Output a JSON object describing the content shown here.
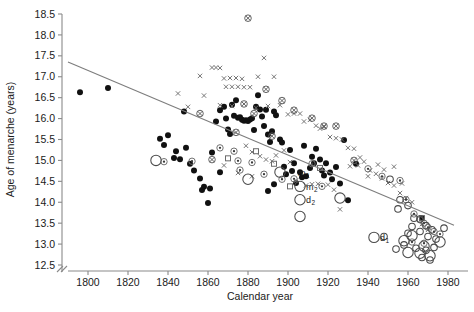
{
  "chart_data": {
    "type": "scatter",
    "title": "",
    "xlabel": "Calendar year",
    "ylabel": "Age of menarche (years)",
    "xlim": [
      1788,
      1990
    ],
    "ylim": [
      12.5,
      18.5
    ],
    "xticks": [
      "1800",
      "1820",
      "1840",
      "1860",
      "1880",
      "1900",
      "1920",
      "1940",
      "1960",
      "1980"
    ],
    "xtick_values": [
      1800,
      1820,
      1840,
      1860,
      1880,
      1900,
      1920,
      1940,
      1960,
      1980
    ],
    "yticks": [
      "12.5",
      "13.0",
      "13.5",
      "14.0",
      "14.5",
      "15.0",
      "15.5",
      "16.0",
      "16.5",
      "17.0",
      "17.5",
      "18.0",
      "18.5"
    ],
    "ytick_values": [
      12.5,
      13.0,
      13.5,
      14.0,
      14.5,
      15.0,
      15.5,
      16.0,
      16.5,
      17.0,
      17.5,
      18.0,
      18.5
    ],
    "grid": false,
    "axis_break": true,
    "legend_position": "none",
    "trend_line": {
      "name": "linear regression",
      "x": [
        1790,
        1983
      ],
      "y": [
        17.35,
        13.45
      ],
      "color": "#7d7d7d"
    },
    "annotations": [
      {
        "label": "m",
        "sub": "1",
        "x": 1902,
        "y": 14.72
      },
      {
        "label": "m",
        "sub": "2",
        "x": 1906,
        "y": 14.38
      },
      {
        "label": "d",
        "sub": "2",
        "x": 1906,
        "y": 14.06
      },
      {
        "label": "d",
        "sub": "1",
        "x": 1943,
        "y": 13.16
      }
    ],
    "series": [
      {
        "name": "filled-circle",
        "marker": "filled-circle",
        "color": "#111111",
        "points": [
          [
            1796,
            16.63
          ],
          [
            1810,
            16.73
          ],
          [
            1838,
            15.37
          ],
          [
            1843,
            15.06
          ],
          [
            1846,
            15.03
          ],
          [
            1849,
            15.3
          ],
          [
            1851,
            14.92
          ],
          [
            1853,
            14.76
          ],
          [
            1856,
            14.57
          ],
          [
            1858,
            14.37
          ],
          [
            1857,
            14.29
          ],
          [
            1861,
            14.33
          ],
          [
            1848,
            16.17
          ],
          [
            1862,
            15.19
          ],
          [
            1864,
            15.93
          ],
          [
            1866,
            16.2
          ],
          [
            1868,
            16.28
          ],
          [
            1869,
            16.0
          ],
          [
            1870,
            15.74
          ],
          [
            1871,
            15.63
          ],
          [
            1872,
            16.33
          ],
          [
            1873,
            16.07
          ],
          [
            1874,
            16.44
          ],
          [
            1875,
            16.02
          ],
          [
            1876,
            16.03
          ],
          [
            1877,
            15.97
          ],
          [
            1878,
            15.95
          ],
          [
            1879,
            15.96
          ],
          [
            1880,
            15.94
          ],
          [
            1881,
            15.98
          ],
          [
            1882,
            16.01
          ],
          [
            1883,
            15.73
          ],
          [
            1884,
            16.28
          ],
          [
            1885,
            16.56
          ],
          [
            1886,
            16.22
          ],
          [
            1887,
            16.05
          ],
          [
            1888,
            15.82
          ],
          [
            1889,
            16.21
          ],
          [
            1890,
            15.62
          ],
          [
            1891,
            15.44
          ],
          [
            1892,
            15.7
          ],
          [
            1893,
            16.17
          ],
          [
            1894,
            16.08
          ],
          [
            1896,
            15.5
          ],
          [
            1897,
            15.43
          ],
          [
            1898,
            14.85
          ],
          [
            1899,
            14.67
          ],
          [
            1901,
            15.25
          ],
          [
            1903,
            14.93
          ],
          [
            1904,
            14.46
          ],
          [
            1906,
            14.72
          ],
          [
            1907,
            14.6
          ],
          [
            1908,
            15.35
          ],
          [
            1909,
            14.62
          ],
          [
            1911,
            14.82
          ],
          [
            1912,
            15.09
          ],
          [
            1913,
            14.93
          ],
          [
            1914,
            15.28
          ],
          [
            1916,
            15.02
          ],
          [
            1917,
            14.76
          ],
          [
            1918,
            14.64
          ],
          [
            1919,
            14.93
          ],
          [
            1921,
            14.71
          ],
          [
            1922,
            14.55
          ],
          [
            1924,
            14.84
          ],
          [
            1926,
            14.45
          ],
          [
            1928,
            15.49
          ],
          [
            1930,
            14.05
          ],
          [
            1860,
            13.98
          ],
          [
            1866,
            14.72
          ],
          [
            1890,
            14.27
          ],
          [
            1893,
            14.43
          ],
          [
            1902,
            14.75
          ],
          [
            1934,
            14.92
          ],
          [
            1836,
            15.52
          ],
          [
            1840,
            15.6
          ],
          [
            1844,
            15.22
          ],
          [
            1967,
            13.62
          ]
        ]
      },
      {
        "name": "x-marker",
        "marker": "x",
        "color": "#6f6f6f",
        "points": [
          [
            1856,
            17.02
          ],
          [
            1862,
            17.22
          ],
          [
            1864,
            17.22
          ],
          [
            1866,
            17.21
          ],
          [
            1868,
            16.96
          ],
          [
            1871,
            16.97
          ],
          [
            1874,
            16.97
          ],
          [
            1877,
            16.95
          ],
          [
            1869,
            16.76
          ],
          [
            1872,
            16.76
          ],
          [
            1875,
            16.76
          ],
          [
            1878,
            16.75
          ],
          [
            1881,
            16.75
          ],
          [
            1885,
            17.0
          ],
          [
            1888,
            17.45
          ],
          [
            1893,
            17.0
          ],
          [
            1858,
            16.55
          ],
          [
            1866,
            16.32
          ],
          [
            1872,
            16.3
          ],
          [
            1884,
            16.26
          ],
          [
            1890,
            16.3
          ],
          [
            1896,
            16.32
          ],
          [
            1900,
            16.1
          ],
          [
            1903,
            16.12
          ],
          [
            1906,
            16.12
          ],
          [
            1908,
            15.93
          ],
          [
            1911,
            15.97
          ],
          [
            1914,
            15.83
          ],
          [
            1916,
            15.76
          ],
          [
            1918,
            15.8
          ],
          [
            1921,
            15.56
          ],
          [
            1924,
            15.53
          ],
          [
            1927,
            15.5
          ],
          [
            1930,
            15.3
          ],
          [
            1933,
            15.28
          ],
          [
            1936,
            15.07
          ],
          [
            1938,
            14.97
          ],
          [
            1941,
            14.76
          ],
          [
            1944,
            14.68
          ],
          [
            1947,
            14.57
          ],
          [
            1950,
            14.46
          ],
          [
            1953,
            14.4
          ],
          [
            1956,
            14.22
          ],
          [
            1959,
            14.1
          ],
          [
            1962,
            14.0
          ],
          [
            1879,
            15.35
          ],
          [
            1882,
            15.2
          ],
          [
            1886,
            15.1
          ],
          [
            1889,
            15.02
          ],
          [
            1892,
            14.98
          ],
          [
            1894,
            15.12
          ],
          [
            1898,
            15.24
          ],
          [
            1901,
            14.96
          ],
          [
            1904,
            14.52
          ],
          [
            1909,
            14.4
          ],
          [
            1912,
            14.43
          ],
          [
            1915,
            14.44
          ],
          [
            1920,
            14.42
          ],
          [
            1923,
            14.3
          ],
          [
            1926,
            13.83
          ],
          [
            1931,
            14.86
          ],
          [
            1935,
            14.88
          ],
          [
            1940,
            14.62
          ],
          [
            1945,
            14.9
          ],
          [
            1948,
            14.78
          ],
          [
            1953,
            14.85
          ],
          [
            1957,
            14.45
          ],
          [
            1967,
            13.48
          ],
          [
            1970,
            13.34
          ],
          [
            1845,
            16.6
          ],
          [
            1850,
            16.28
          ],
          [
            1868,
            14.88
          ],
          [
            1875,
            14.7
          ],
          [
            1882,
            14.62
          ]
        ]
      },
      {
        "name": "dotted-circle",
        "marker": "dotted-circle",
        "color": "#6a6a6a",
        "points": [
          [
            1838,
            14.97
          ],
          [
            1852,
            14.98
          ],
          [
            1866,
            15.3
          ],
          [
            1873,
            15.22
          ],
          [
            1875,
            14.99
          ],
          [
            1876,
            14.77
          ],
          [
            1882,
            14.95
          ],
          [
            1888,
            14.67
          ],
          [
            1897,
            14.55
          ],
          [
            1903,
            14.56
          ],
          [
            1912,
            14.92
          ],
          [
            1917,
            14.38
          ],
          [
            1940,
            14.8
          ],
          [
            1947,
            14.62
          ],
          [
            1956,
            14.52
          ],
          [
            1963,
            13.72
          ],
          [
            1966,
            13.58
          ],
          [
            1968,
            13.5
          ],
          [
            1970,
            13.4
          ],
          [
            1973,
            13.3
          ],
          [
            1962,
            13.05
          ],
          [
            1968,
            13.02
          ],
          [
            1976,
            13.24
          ],
          [
            1959,
            14.06
          ]
        ]
      },
      {
        "name": "crossed-circle",
        "marker": "crossed-circle",
        "color": "#5a5a5a",
        "points": [
          [
            1880,
            18.4
          ],
          [
            1889,
            16.7
          ],
          [
            1897,
            16.43
          ],
          [
            1903,
            16.2
          ],
          [
            1912,
            16.01
          ],
          [
            1918,
            15.82
          ],
          [
            1924,
            15.82
          ],
          [
            1878,
            16.35
          ],
          [
            1883,
            16.12
          ],
          [
            1874,
            15.67
          ],
          [
            1892,
            15.58
          ],
          [
            1933,
            15.0
          ],
          [
            1856,
            16.12
          ],
          [
            1862,
            15.02
          ]
        ]
      },
      {
        "name": "open-square",
        "marker": "open-square",
        "color": "#6a6a6a",
        "points": [
          [
            1884,
            15.22
          ],
          [
            1893,
            14.92
          ],
          [
            1901,
            14.38
          ],
          [
            1916,
            14.82
          ],
          [
            1967,
            13.62
          ],
          [
            1870,
            15.05
          ]
        ]
      },
      {
        "name": "open-circle-large",
        "marker": "open-circle",
        "size": 5.2,
        "color": "#4a4a4a",
        "points": [
          [
            1834,
            15.0
          ],
          [
            1880,
            14.55
          ],
          [
            1896,
            14.72
          ],
          [
            1906,
            14.38
          ],
          [
            1906,
            14.06
          ],
          [
            1906,
            13.66
          ],
          [
            1926,
            14.1
          ],
          [
            1943,
            13.16
          ],
          [
            1958,
            13.08
          ],
          [
            1962,
            13.2
          ],
          [
            1968,
            12.95
          ],
          [
            1976,
            13.05
          ],
          [
            1960,
            12.8
          ],
          [
            1966,
            12.78
          ],
          [
            1971,
            12.72
          ]
        ]
      },
      {
        "name": "open-circle-small",
        "marker": "open-circle",
        "size": 3.3,
        "color": "#4a4a4a",
        "points": [
          [
            1951,
            14.55
          ],
          [
            1956,
            14.06
          ],
          [
            1960,
            13.92
          ],
          [
            1955,
            13.84
          ],
          [
            1963,
            13.62
          ],
          [
            1966,
            13.6
          ],
          [
            1962,
            13.42
          ],
          [
            1969,
            13.44
          ],
          [
            1966,
            13.3
          ],
          [
            1972,
            13.34
          ],
          [
            1960,
            13.26
          ],
          [
            1970,
            13.18
          ],
          [
            1974,
            13.12
          ],
          [
            1958,
            12.98
          ],
          [
            1964,
            12.9
          ],
          [
            1969,
            12.85
          ],
          [
            1973,
            12.92
          ],
          [
            1967,
            12.68
          ],
          [
            1971,
            12.62
          ],
          [
            1978,
            13.38
          ],
          [
            1948,
            13.18
          ],
          [
            1954,
            12.88
          ]
        ]
      }
    ]
  }
}
